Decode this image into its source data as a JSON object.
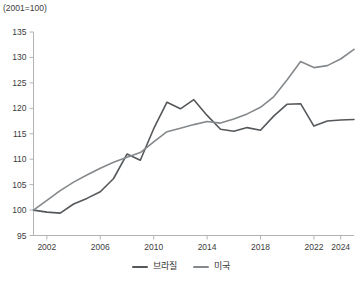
{
  "chart_data": {
    "type": "line",
    "title": "",
    "note": "(2001=100)",
    "xlabel": "",
    "ylabel": "",
    "grid": false,
    "legend_position": "bottom",
    "xlim": [
      2001,
      2025
    ],
    "ylim": [
      95,
      135
    ],
    "x_ticks": [
      2002,
      2006,
      2010,
      2014,
      2018,
      2022,
      2024
    ],
    "y_ticks": [
      95,
      100,
      105,
      110,
      115,
      120,
      125,
      130,
      135
    ],
    "x": [
      2001,
      2002,
      2003,
      2004,
      2005,
      2006,
      2007,
      2008,
      2009,
      2010,
      2011,
      2012,
      2013,
      2014,
      2015,
      2016,
      2017,
      2018,
      2019,
      2020,
      2021,
      2022,
      2023,
      2024,
      2025
    ],
    "series": [
      {
        "name": "브라질",
        "color": "#54585b",
        "values": [
          100,
          99.6,
          99.4,
          101.2,
          102.3,
          103.6,
          106.2,
          111.0,
          109.8,
          116.0,
          121.2,
          119.9,
          121.7,
          118.6,
          115.9,
          115.5,
          116.2,
          115.7,
          118.5,
          120.8,
          120.9,
          116.5,
          117.5,
          117.7,
          117.8
        ]
      },
      {
        "name": "미국",
        "color": "#85898c",
        "values": [
          100,
          101.9,
          103.8,
          105.5,
          106.9,
          108.2,
          109.4,
          110.4,
          111.3,
          113.4,
          115.4,
          116.1,
          116.8,
          117.4,
          117.1,
          117.9,
          118.9,
          120.2,
          122.3,
          125.6,
          129.2,
          128.0,
          128.4,
          129.7,
          131.6
        ]
      }
    ],
    "axis_color": "#b3b3b3",
    "tick_label_color": "#3c3c3c"
  }
}
